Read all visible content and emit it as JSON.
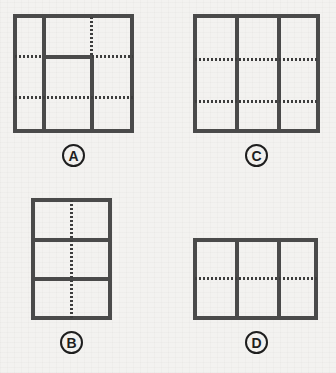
{
  "puzzle": {
    "type": "visual-spatial-reasoning-options",
    "background_color": "#f2f1ef",
    "solid_line_color": "#4a4a4a",
    "dotted_line_color": "#3d3d3d",
    "label_color": "#1e1e1e",
    "option_count": 4
  },
  "options": [
    {
      "label": "A",
      "position": "top-left",
      "shape": "square",
      "bounds": {
        "x": 13,
        "y": 14,
        "width": 121,
        "height": 119
      },
      "solid_lines": [
        {
          "orientation": "vertical",
          "at": 42,
          "from": 14,
          "to": 133,
          "full_span": true
        },
        {
          "orientation": "vertical",
          "at": 90,
          "from": 55,
          "to": 133,
          "full_span": false
        },
        {
          "orientation": "horizontal",
          "at": 55,
          "from": 42,
          "to": 90,
          "full_span": false
        }
      ],
      "dotted_lines": [
        {
          "orientation": "vertical",
          "at": 90,
          "from": 14,
          "to": 55,
          "full_span": false
        },
        {
          "orientation": "horizontal",
          "at": 55,
          "from": 13,
          "to": 42,
          "full_span": false
        },
        {
          "orientation": "horizontal",
          "at": 55,
          "from": 90,
          "to": 134,
          "full_span": false
        },
        {
          "orientation": "horizontal",
          "at": 96,
          "from": 13,
          "to": 134,
          "full_span": true
        }
      ],
      "solid_divider_count": 3,
      "dotted_guide_count": 4
    },
    {
      "label": "B",
      "position": "bottom-left",
      "shape": "portrait-rectangle",
      "bounds": {
        "x": 31,
        "y": 198,
        "width": 81,
        "height": 122
      },
      "solid_lines": [
        {
          "orientation": "horizontal",
          "at": 238,
          "from": 31,
          "to": 112,
          "full_span": true
        },
        {
          "orientation": "horizontal",
          "at": 277,
          "from": 31,
          "to": 112,
          "full_span": true
        }
      ],
      "dotted_lines": [
        {
          "orientation": "vertical",
          "at": 71,
          "from": 198,
          "to": 320,
          "full_span": true
        }
      ],
      "solid_divider_count": 2,
      "dotted_guide_count": 1
    },
    {
      "label": "C",
      "position": "top-right",
      "shape": "square",
      "bounds": {
        "x": 193,
        "y": 14,
        "width": 127,
        "height": 119
      },
      "solid_lines": [
        {
          "orientation": "vertical",
          "at": 235,
          "from": 14,
          "to": 133,
          "full_span": true
        },
        {
          "orientation": "vertical",
          "at": 277,
          "from": 14,
          "to": 133,
          "full_span": true
        }
      ],
      "dotted_lines": [
        {
          "orientation": "horizontal",
          "at": 58,
          "from": 193,
          "to": 320,
          "full_span": true
        },
        {
          "orientation": "horizontal",
          "at": 100,
          "from": 193,
          "to": 320,
          "full_span": true
        }
      ],
      "solid_divider_count": 2,
      "dotted_guide_count": 2
    },
    {
      "label": "D",
      "position": "bottom-right",
      "shape": "landscape-rectangle",
      "bounds": {
        "x": 193,
        "y": 238,
        "width": 125,
        "height": 82
      },
      "solid_lines": [
        {
          "orientation": "vertical",
          "at": 235,
          "from": 238,
          "to": 320,
          "full_span": true
        },
        {
          "orientation": "vertical",
          "at": 277,
          "from": 238,
          "to": 320,
          "full_span": true
        }
      ],
      "dotted_lines": [
        {
          "orientation": "horizontal",
          "at": 278,
          "from": 193,
          "to": 318,
          "full_span": true
        }
      ],
      "solid_divider_count": 2,
      "dotted_guide_count": 1
    }
  ]
}
